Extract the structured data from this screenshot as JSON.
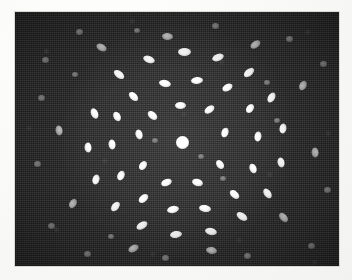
{
  "image": {
    "kind": "electron-diffraction-micrograph",
    "description": "Selected-area electron diffraction pattern showing concentric rings of elongated diffraction spots around a bright central transmitted beam",
    "width_px": 352,
    "height_px": 280,
    "plate": {
      "left_px": 15,
      "top_px": 12,
      "width_px": 324,
      "height_px": 254
    },
    "colors": {
      "paper": "#fdfdfb",
      "background": "#2e2e2e",
      "spot_bright": "#ffffff",
      "spot_dim": "#b4b4b4",
      "spot_faint": "#7a7a7a",
      "border": "#d9d9d6"
    }
  },
  "chart_data": {
    "type": "scatter",
    "title": "",
    "subtitle": "",
    "xlabel": "",
    "ylabel": "",
    "xlim": [
      0,
      324
    ],
    "ylim": [
      0,
      254
    ],
    "grid": false,
    "legend": "none",
    "annotations": [],
    "center_beam": {
      "x": 167,
      "y": 130,
      "d": 13,
      "class": "center"
    },
    "rings": [
      {
        "name": "ring-1",
        "radius_px": 40,
        "spot_count": 10
      },
      {
        "name": "ring-2",
        "radius_px": 62,
        "spot_count": 14
      },
      {
        "name": "ring-3",
        "radius_px": 88,
        "spot_count": 18
      },
      {
        "name": "ring-4",
        "radius_px": 118,
        "spot_count": 16
      },
      {
        "name": "ring-5",
        "radius_px": 150,
        "spot_count": 10
      }
    ],
    "spots": [
      {
        "x": 167,
        "y": 130,
        "w": 13,
        "h": 13,
        "a": 0,
        "c": "center"
      },
      {
        "x": 137,
        "y": 103,
        "w": 11,
        "h": 7,
        "a": 40,
        "c": ""
      },
      {
        "x": 165,
        "y": 93,
        "w": 11,
        "h": 7,
        "a": 0,
        "c": ""
      },
      {
        "x": 194,
        "y": 97,
        "w": 11,
        "h": 7,
        "a": -35,
        "c": ""
      },
      {
        "x": 210,
        "y": 120,
        "w": 10,
        "h": 7,
        "a": -70,
        "c": ""
      },
      {
        "x": 205,
        "y": 152,
        "w": 10,
        "h": 7,
        "a": 55,
        "c": ""
      },
      {
        "x": 182,
        "y": 170,
        "w": 11,
        "h": 7,
        "a": 15,
        "c": ""
      },
      {
        "x": 151,
        "y": 170,
        "w": 11,
        "h": 7,
        "a": -20,
        "c": ""
      },
      {
        "x": 128,
        "y": 153,
        "w": 10,
        "h": 7,
        "a": -55,
        "c": ""
      },
      {
        "x": 124,
        "y": 122,
        "w": 10,
        "h": 7,
        "a": 72,
        "c": ""
      },
      {
        "x": 118,
        "y": 84,
        "w": 11,
        "h": 7,
        "a": 45,
        "c": ""
      },
      {
        "x": 150,
        "y": 71,
        "w": 12,
        "h": 7,
        "a": 12,
        "c": ""
      },
      {
        "x": 182,
        "y": 68,
        "w": 12,
        "h": 7,
        "a": -5,
        "c": ""
      },
      {
        "x": 212,
        "y": 75,
        "w": 11,
        "h": 7,
        "a": -30,
        "c": ""
      },
      {
        "x": 235,
        "y": 96,
        "w": 10,
        "h": 7,
        "a": -55,
        "c": ""
      },
      {
        "x": 243,
        "y": 124,
        "w": 10,
        "h": 7,
        "a": -80,
        "c": ""
      },
      {
        "x": 238,
        "y": 156,
        "w": 10,
        "h": 7,
        "a": 68,
        "c": ""
      },
      {
        "x": 219,
        "y": 182,
        "w": 11,
        "h": 7,
        "a": 42,
        "c": ""
      },
      {
        "x": 190,
        "y": 196,
        "w": 12,
        "h": 7,
        "a": 10,
        "c": ""
      },
      {
        "x": 158,
        "y": 197,
        "w": 12,
        "h": 7,
        "a": -12,
        "c": ""
      },
      {
        "x": 128,
        "y": 186,
        "w": 11,
        "h": 7,
        "a": -40,
        "c": ""
      },
      {
        "x": 106,
        "y": 163,
        "w": 10,
        "h": 7,
        "a": -65,
        "c": ""
      },
      {
        "x": 97,
        "y": 132,
        "w": 10,
        "h": 7,
        "a": 84,
        "c": ""
      },
      {
        "x": 102,
        "y": 104,
        "w": 10,
        "h": 7,
        "a": 62,
        "c": ""
      },
      {
        "x": 104,
        "y": 62,
        "w": 12,
        "h": 7,
        "a": 38,
        "c": ""
      },
      {
        "x": 134,
        "y": 47,
        "w": 12,
        "h": 7,
        "a": 20,
        "c": ""
      },
      {
        "x": 169,
        "y": 40,
        "w": 13,
        "h": 8,
        "a": 0,
        "c": ""
      },
      {
        "x": 203,
        "y": 45,
        "w": 12,
        "h": 7,
        "a": -20,
        "c": ""
      },
      {
        "x": 234,
        "y": 60,
        "w": 12,
        "h": 7,
        "a": -40,
        "c": ""
      },
      {
        "x": 256,
        "y": 85,
        "w": 11,
        "h": 7,
        "a": -60,
        "c": ""
      },
      {
        "x": 268,
        "y": 116,
        "w": 10,
        "h": 7,
        "a": -80,
        "c": ""
      },
      {
        "x": 266,
        "y": 150,
        "w": 10,
        "h": 7,
        "a": 78,
        "c": ""
      },
      {
        "x": 252,
        "y": 181,
        "w": 11,
        "h": 7,
        "a": 55,
        "c": ""
      },
      {
        "x": 227,
        "y": 204,
        "w": 12,
        "h": 7,
        "a": 33,
        "c": ""
      },
      {
        "x": 196,
        "y": 219,
        "w": 12,
        "h": 7,
        "a": 12,
        "c": ""
      },
      {
        "x": 161,
        "y": 222,
        "w": 12,
        "h": 7,
        "a": -8,
        "c": ""
      },
      {
        "x": 127,
        "y": 213,
        "w": 12,
        "h": 7,
        "a": -30,
        "c": ""
      },
      {
        "x": 100,
        "y": 194,
        "w": 11,
        "h": 7,
        "a": -50,
        "c": ""
      },
      {
        "x": 81,
        "y": 167,
        "w": 10,
        "h": 7,
        "a": -72,
        "c": ""
      },
      {
        "x": 73,
        "y": 135,
        "w": 10,
        "h": 7,
        "a": 88,
        "c": ""
      },
      {
        "x": 79,
        "y": 101,
        "w": 11,
        "h": 7,
        "a": 66,
        "c": ""
      },
      {
        "x": 86,
        "y": 35,
        "w": 11,
        "h": 7,
        "a": 30,
        "c": "dim"
      },
      {
        "x": 152,
        "y": 24,
        "w": 11,
        "h": 7,
        "a": 5,
        "c": "dim"
      },
      {
        "x": 240,
        "y": 32,
        "w": 11,
        "h": 7,
        "a": -35,
        "c": "dim"
      },
      {
        "x": 288,
        "y": 73,
        "w": 10,
        "h": 7,
        "a": -62,
        "c": "dim"
      },
      {
        "x": 300,
        "y": 140,
        "w": 10,
        "h": 7,
        "a": 85,
        "c": "dim"
      },
      {
        "x": 268,
        "y": 205,
        "w": 11,
        "h": 7,
        "a": 48,
        "c": "dim"
      },
      {
        "x": 196,
        "y": 238,
        "w": 11,
        "h": 7,
        "a": 10,
        "c": "dim"
      },
      {
        "x": 118,
        "y": 236,
        "w": 11,
        "h": 7,
        "a": -28,
        "c": "dim"
      },
      {
        "x": 58,
        "y": 191,
        "w": 10,
        "h": 7,
        "a": -58,
        "c": "dim"
      },
      {
        "x": 44,
        "y": 118,
        "w": 10,
        "h": 7,
        "a": 80,
        "c": "dim"
      },
      {
        "x": 30,
        "y": 48,
        "w": 7,
        "h": 6,
        "a": 0,
        "c": "faint"
      },
      {
        "x": 64,
        "y": 20,
        "w": 7,
        "h": 6,
        "a": 0,
        "c": "faint"
      },
      {
        "x": 200,
        "y": 14,
        "w": 7,
        "h": 6,
        "a": 0,
        "c": "faint"
      },
      {
        "x": 274,
        "y": 27,
        "w": 7,
        "h": 6,
        "a": 0,
        "c": "faint"
      },
      {
        "x": 308,
        "y": 52,
        "w": 7,
        "h": 6,
        "a": 0,
        "c": "faint"
      },
      {
        "x": 312,
        "y": 178,
        "w": 7,
        "h": 6,
        "a": 0,
        "c": "faint"
      },
      {
        "x": 296,
        "y": 234,
        "w": 7,
        "h": 6,
        "a": 0,
        "c": "faint"
      },
      {
        "x": 232,
        "y": 244,
        "w": 7,
        "h": 6,
        "a": 0,
        "c": "faint"
      },
      {
        "x": 150,
        "y": 246,
        "w": 7,
        "h": 6,
        "a": 0,
        "c": "faint"
      },
      {
        "x": 72,
        "y": 242,
        "w": 7,
        "h": 6,
        "a": 0,
        "c": "faint"
      },
      {
        "x": 36,
        "y": 214,
        "w": 7,
        "h": 6,
        "a": 0,
        "c": "faint"
      },
      {
        "x": 22,
        "y": 152,
        "w": 7,
        "h": 6,
        "a": 0,
        "c": "faint"
      },
      {
        "x": 26,
        "y": 86,
        "w": 7,
        "h": 6,
        "a": 0,
        "c": "faint"
      },
      {
        "x": 122,
        "y": 18,
        "w": 6,
        "h": 5,
        "a": 0,
        "c": "faint"
      },
      {
        "x": 262,
        "y": 108,
        "w": 6,
        "h": 5,
        "a": 0,
        "c": "faint"
      },
      {
        "x": 60,
        "y": 62,
        "w": 6,
        "h": 5,
        "a": 0,
        "c": "faint"
      },
      {
        "x": 208,
        "y": 166,
        "w": 6,
        "h": 5,
        "a": 0,
        "c": "faint"
      },
      {
        "x": 140,
        "y": 128,
        "w": 6,
        "h": 5,
        "a": 0,
        "c": "faint"
      },
      {
        "x": 186,
        "y": 144,
        "w": 6,
        "h": 5,
        "a": 0,
        "c": "faint"
      },
      {
        "x": 96,
        "y": 224,
        "w": 6,
        "h": 5,
        "a": 0,
        "c": "faint"
      },
      {
        "x": 252,
        "y": 70,
        "w": 6,
        "h": 5,
        "a": 0,
        "c": "faint"
      }
    ]
  }
}
